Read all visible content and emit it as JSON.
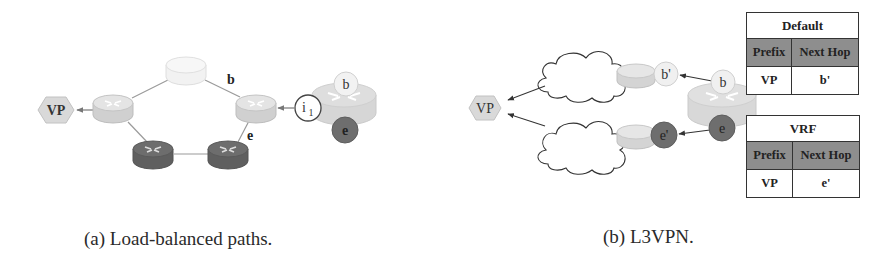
{
  "figure": {
    "panels": [
      {
        "id": "a",
        "caption": "(a) Load-balanced paths.",
        "nodes": {
          "vp_label": "VP",
          "interface_i1_label": "i",
          "interface_i1_sub": "1",
          "big_router_b_label": "b",
          "big_router_e_label": "e",
          "link_b_label": "b",
          "link_e_label": "e"
        }
      },
      {
        "id": "b",
        "caption": "(b) L3VPN.",
        "nodes": {
          "vp_label": "VP",
          "b_prime_label": "b'",
          "e_prime_label": "e'",
          "big_router_b_label": "b",
          "big_router_e_label": "e"
        },
        "tables": [
          {
            "title": "Default",
            "headers": [
              "Prefix",
              "Next Hop"
            ],
            "rows": [
              [
                "VP",
                "b'"
              ]
            ]
          },
          {
            "title": "VRF",
            "headers": [
              "Prefix",
              "Next Hop"
            ],
            "rows": [
              [
                "VP",
                "e'"
              ]
            ]
          }
        ]
      }
    ],
    "colors": {
      "router_light": "#dcdcdc",
      "router_faint": "#efefef",
      "router_dark": "#6b6b6b",
      "circle_dark": "#6e6e6e",
      "table_header": "#8e8e8e",
      "hexagon": "#d9d9d9"
    }
  }
}
